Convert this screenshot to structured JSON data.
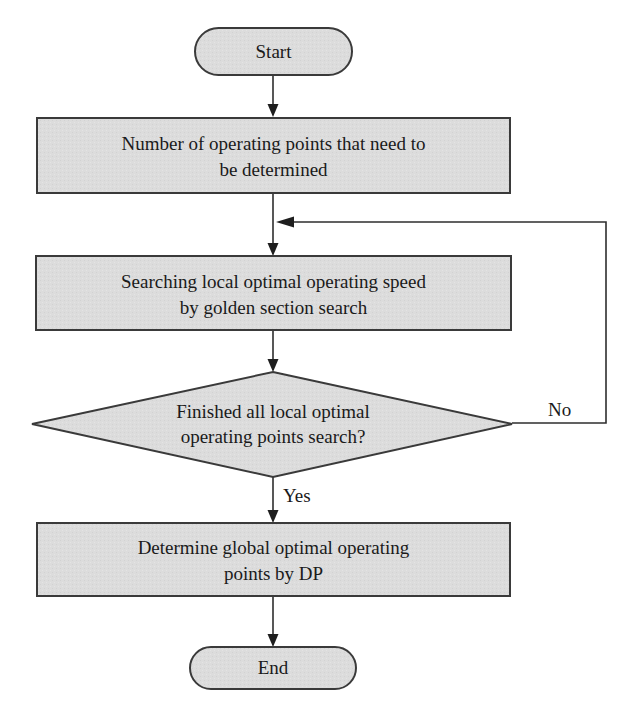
{
  "diagram": {
    "type": "flowchart",
    "colors": {
      "node_fill": "#dcdcdc",
      "node_border": "#3a3a3a",
      "line": "#2e2e2e",
      "text": "#1a1a1a",
      "background": "#ffffff"
    },
    "nodes": {
      "start": {
        "shape": "terminal",
        "label": "Start"
      },
      "count_points": {
        "shape": "process",
        "lines": [
          "Number of operating points that need to",
          "be determined"
        ]
      },
      "local_search": {
        "shape": "process",
        "lines": [
          "Searching local optimal operating speed",
          "by golden section search"
        ]
      },
      "finished_check": {
        "shape": "decision",
        "lines": [
          "Finished all local optimal",
          "operating points search?"
        ]
      },
      "global_dp": {
        "shape": "process",
        "lines": [
          "Determine global optimal operating",
          "points by DP"
        ]
      },
      "end": {
        "shape": "terminal",
        "label": "End"
      }
    },
    "edges": [
      {
        "from": "start",
        "to": "count_points",
        "label": ""
      },
      {
        "from": "count_points",
        "to": "local_search",
        "label": ""
      },
      {
        "from": "local_search",
        "to": "finished_check",
        "label": ""
      },
      {
        "from": "finished_check",
        "to": "global_dp",
        "label": "Yes"
      },
      {
        "from": "finished_check",
        "to": "local_search",
        "label": "No"
      },
      {
        "from": "global_dp",
        "to": "end",
        "label": ""
      }
    ],
    "edge_labels": {
      "yes": "Yes",
      "no": "No"
    }
  }
}
